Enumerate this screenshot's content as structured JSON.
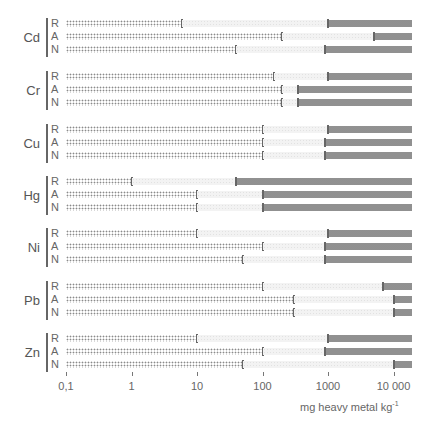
{
  "chart_data": {
    "type": "bar",
    "subtype": "horizontal log-scale range bars",
    "title": "",
    "xlabel": "mg heavy metal kg",
    "xlabel_superscript": "-1",
    "xscale": "log",
    "xlim": [
      0.1,
      20000
    ],
    "xticks": [
      0.1,
      1,
      10,
      100,
      1000,
      10000
    ],
    "xtick_labels": [
      "0,1",
      "1",
      "10",
      "100",
      "1000",
      "10 000"
    ],
    "grid": false,
    "legend": null,
    "row_labels": [
      "R",
      "A",
      "N"
    ],
    "segments_description": "Each row shows a dense-dotted bar from 0.1 to a lower threshold, a faint gap, and a cross-hatched bar from an upper threshold to the axis end",
    "groups": [
      {
        "metal": "Cd",
        "rows": [
          {
            "label": "R",
            "low_end": 6,
            "high_start": 1000
          },
          {
            "label": "A",
            "low_end": 200,
            "high_start": 5000
          },
          {
            "label": "N",
            "low_end": 40,
            "high_start": 900
          }
        ]
      },
      {
        "metal": "Cr",
        "rows": [
          {
            "label": "R",
            "low_end": 150,
            "high_start": 1000
          },
          {
            "label": "A",
            "low_end": 200,
            "high_start": 350
          },
          {
            "label": "N",
            "low_end": 200,
            "high_start": 350
          }
        ]
      },
      {
        "metal": "Cu",
        "rows": [
          {
            "label": "R",
            "low_end": 100,
            "high_start": 1000
          },
          {
            "label": "A",
            "low_end": 100,
            "high_start": 900
          },
          {
            "label": "N",
            "low_end": 100,
            "high_start": 900
          }
        ]
      },
      {
        "metal": "Hg",
        "rows": [
          {
            "label": "R",
            "low_end": 1,
            "high_start": 40
          },
          {
            "label": "A",
            "low_end": 10,
            "high_start": 100
          },
          {
            "label": "N",
            "low_end": 10,
            "high_start": 100
          }
        ]
      },
      {
        "metal": "Ni",
        "rows": [
          {
            "label": "R",
            "low_end": 10,
            "high_start": 1000
          },
          {
            "label": "A",
            "low_end": 100,
            "high_start": 900
          },
          {
            "label": "N",
            "low_end": 50,
            "high_start": 900
          }
        ]
      },
      {
        "metal": "Pb",
        "rows": [
          {
            "label": "R",
            "low_end": 100,
            "high_start": 7000
          },
          {
            "label": "A",
            "low_end": 300,
            "high_start": 10000
          },
          {
            "label": "N",
            "low_end": 300,
            "high_start": 10000
          }
        ]
      },
      {
        "metal": "Zn",
        "rows": [
          {
            "label": "R",
            "low_end": 10,
            "high_start": 1000
          },
          {
            "label": "A",
            "low_end": 100,
            "high_start": 900
          },
          {
            "label": "N",
            "low_end": 50,
            "high_start": 10000
          }
        ]
      }
    ]
  },
  "axis": {
    "unit_text": "mg heavy metal kg",
    "unit_sup": "-1"
  },
  "colors": {
    "low_dots": "#8a8a8a",
    "gap": "#f3f3f3",
    "high_hatch": "#8f8f8f",
    "text": "#555555"
  }
}
